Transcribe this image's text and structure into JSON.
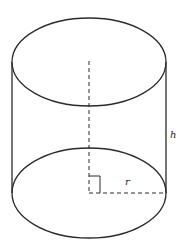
{
  "diagram": {
    "type": "cylinder",
    "labels": {
      "height": "h",
      "radius": "r"
    },
    "colors": {
      "stroke": "#2a2a2a",
      "background": "#ffffff"
    }
  }
}
